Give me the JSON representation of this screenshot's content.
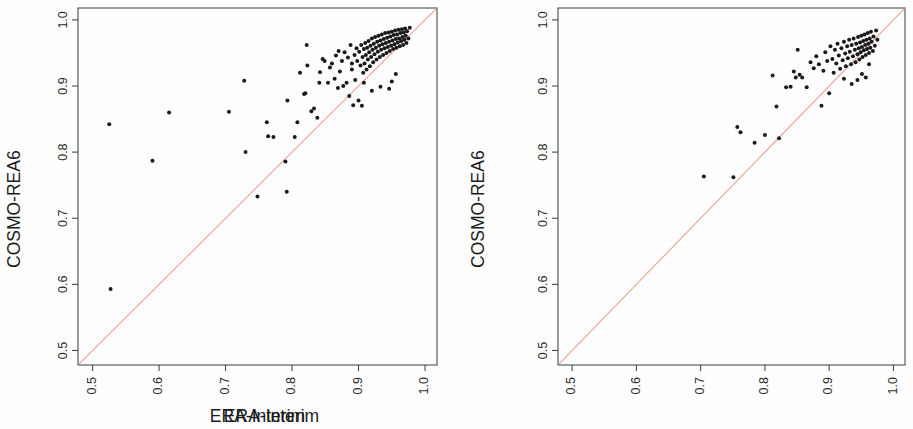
{
  "figure": {
    "width": 913,
    "height": 429,
    "background": "#fefefe",
    "panel_count": 2
  },
  "style": {
    "point_color": "#1a1a1a",
    "line_color": "#f2a090",
    "axis_color": "#3a3a3a",
    "text_color": "#1c1c1c",
    "point_radius": 2.0,
    "line_width": 1.1
  },
  "chart_data": [
    {
      "type": "scatter",
      "panel": "left",
      "title": "",
      "xlabel": "ERA-Interim",
      "ylabel": "COSMO-REA6",
      "xlim": [
        0.478,
        1.018
      ],
      "ylim": [
        0.478,
        1.018
      ],
      "xticks": [
        0.5,
        0.6,
        0.7,
        0.8,
        0.9,
        1.0
      ],
      "xticklabels": [
        "0.5",
        "0.6",
        "0.7",
        "0.8",
        "0.9",
        "1.0"
      ],
      "yticks": [
        0.5,
        0.6,
        0.7,
        0.8,
        0.9,
        1.0
      ],
      "yticklabels": [
        "0.5",
        "0.6",
        "0.7",
        "0.8",
        "0.9",
        "1.0"
      ],
      "grid": false,
      "legend": null,
      "reference_line": {
        "kind": "identity",
        "label": "1:1 line",
        "from": [
          0.478,
          0.478
        ],
        "to": [
          1.018,
          1.018
        ],
        "color": "#f2a090"
      },
      "n_points": 131,
      "points": [
        [
          0.527,
          0.593
        ],
        [
          0.525,
          0.842
        ],
        [
          0.59,
          0.787
        ],
        [
          0.615,
          0.86
        ],
        [
          0.705,
          0.861
        ],
        [
          0.728,
          0.908
        ],
        [
          0.73,
          0.8
        ],
        [
          0.748,
          0.733
        ],
        [
          0.762,
          0.845
        ],
        [
          0.764,
          0.824
        ],
        [
          0.772,
          0.823
        ],
        [
          0.79,
          0.786
        ],
        [
          0.792,
          0.74
        ],
        [
          0.793,
          0.878
        ],
        [
          0.804,
          0.823
        ],
        [
          0.808,
          0.845
        ],
        [
          0.812,
          0.92
        ],
        [
          0.818,
          0.888
        ],
        [
          0.82,
          0.889
        ],
        [
          0.822,
          0.962
        ],
        [
          0.823,
          0.931
        ],
        [
          0.829,
          0.862
        ],
        [
          0.833,
          0.866
        ],
        [
          0.838,
          0.852
        ],
        [
          0.841,
          0.905
        ],
        [
          0.846,
          0.941
        ],
        [
          0.849,
          0.938
        ],
        [
          0.854,
          0.905
        ],
        [
          0.857,
          0.928
        ],
        [
          0.86,
          0.934
        ],
        [
          0.864,
          0.911
        ],
        [
          0.866,
          0.946
        ],
        [
          0.869,
          0.897
        ],
        [
          0.872,
          0.922
        ],
        [
          0.875,
          0.938
        ],
        [
          0.877,
          0.9
        ],
        [
          0.879,
          0.951
        ],
        [
          0.882,
          0.905
        ],
        [
          0.884,
          0.943
        ],
        [
          0.886,
          0.885
        ],
        [
          0.888,
          0.962
        ],
        [
          0.89,
          0.925
        ],
        [
          0.892,
          0.871
        ],
        [
          0.894,
          0.947
        ],
        [
          0.895,
          0.909
        ],
        [
          0.897,
          0.957
        ],
        [
          0.898,
          0.938
        ],
        [
          0.9,
          0.878
        ],
        [
          0.901,
          0.952
        ],
        [
          0.903,
          0.931
        ],
        [
          0.904,
          0.962
        ],
        [
          0.905,
          0.87
        ],
        [
          0.906,
          0.944
        ],
        [
          0.907,
          0.92
        ],
        [
          0.908,
          0.956
        ],
        [
          0.909,
          0.934
        ],
        [
          0.91,
          0.965
        ],
        [
          0.911,
          0.947
        ],
        [
          0.912,
          0.925
        ],
        [
          0.913,
          0.958
        ],
        [
          0.914,
          0.94
        ],
        [
          0.915,
          0.968
        ],
        [
          0.916,
          0.951
        ],
        [
          0.917,
          0.93
        ],
        [
          0.918,
          0.961
        ],
        [
          0.919,
          0.944
        ],
        [
          0.92,
          0.972
        ],
        [
          0.921,
          0.955
        ],
        [
          0.922,
          0.936
        ],
        [
          0.923,
          0.964
        ],
        [
          0.924,
          0.948
        ],
        [
          0.925,
          0.974
        ],
        [
          0.926,
          0.958
        ],
        [
          0.927,
          0.94
        ],
        [
          0.928,
          0.967
        ],
        [
          0.929,
          0.952
        ],
        [
          0.93,
          0.976
        ],
        [
          0.931,
          0.961
        ],
        [
          0.932,
          0.944
        ],
        [
          0.933,
          0.969
        ],
        [
          0.934,
          0.955
        ],
        [
          0.935,
          0.978
        ],
        [
          0.936,
          0.963
        ],
        [
          0.937,
          0.947
        ],
        [
          0.938,
          0.971
        ],
        [
          0.939,
          0.957
        ],
        [
          0.94,
          0.98
        ],
        [
          0.941,
          0.965
        ],
        [
          0.942,
          0.95
        ],
        [
          0.943,
          0.973
        ],
        [
          0.944,
          0.959
        ],
        [
          0.945,
          0.981
        ],
        [
          0.946,
          0.967
        ],
        [
          0.947,
          0.953
        ],
        [
          0.948,
          0.975
        ],
        [
          0.949,
          0.961
        ],
        [
          0.95,
          0.982
        ],
        [
          0.951,
          0.969
        ],
        [
          0.952,
          0.956
        ],
        [
          0.953,
          0.977
        ],
        [
          0.954,
          0.963
        ],
        [
          0.955,
          0.984
        ],
        [
          0.956,
          0.971
        ],
        [
          0.957,
          0.958
        ],
        [
          0.958,
          0.978
        ],
        [
          0.959,
          0.966
        ],
        [
          0.96,
          0.985
        ],
        [
          0.961,
          0.972
        ],
        [
          0.962,
          0.96
        ],
        [
          0.963,
          0.98
        ],
        [
          0.964,
          0.968
        ],
        [
          0.965,
          0.986
        ],
        [
          0.966,
          0.974
        ],
        [
          0.967,
          0.962
        ],
        [
          0.968,
          0.981
        ],
        [
          0.969,
          0.97
        ],
        [
          0.97,
          0.987
        ],
        [
          0.971,
          0.976
        ],
        [
          0.972,
          0.965
        ],
        [
          0.973,
          0.983
        ],
        [
          0.975,
          0.972
        ],
        [
          0.977,
          0.988
        ],
        [
          0.933,
          0.899
        ],
        [
          0.946,
          0.896
        ],
        [
          0.95,
          0.907
        ],
        [
          0.956,
          0.918
        ],
        [
          0.92,
          0.893
        ],
        [
          0.908,
          0.905
        ],
        [
          0.89,
          0.934
        ],
        [
          0.87,
          0.953
        ],
        [
          0.842,
          0.921
        ]
      ]
    },
    {
      "type": "scatter",
      "panel": "right",
      "title": "",
      "xlabel": "ERA-Interim",
      "ylabel": "COSMO-REA6",
      "xlim": [
        0.478,
        1.018
      ],
      "ylim": [
        0.478,
        1.018
      ],
      "xticks": [
        0.5,
        0.6,
        0.7,
        0.8,
        0.9,
        1.0
      ],
      "xticklabels": [
        "0.5",
        "0.6",
        "0.7",
        "0.8",
        "0.9",
        "1.0"
      ],
      "yticks": [
        0.5,
        0.6,
        0.7,
        0.8,
        0.9,
        1.0
      ],
      "yticklabels": [
        "0.5",
        "0.6",
        "0.7",
        "0.8",
        "0.9",
        "1.0"
      ],
      "grid": false,
      "legend": null,
      "reference_line": {
        "kind": "identity",
        "label": "1:1 line",
        "from": [
          0.478,
          0.478
        ],
        "to": [
          1.018,
          1.018
        ],
        "color": "#f2a090"
      },
      "n_points": 84,
      "points": [
        [
          0.705,
          0.763
        ],
        [
          0.751,
          0.762
        ],
        [
          0.757,
          0.838
        ],
        [
          0.762,
          0.83
        ],
        [
          0.784,
          0.814
        ],
        [
          0.8,
          0.826
        ],
        [
          0.812,
          0.916
        ],
        [
          0.818,
          0.869
        ],
        [
          0.822,
          0.821
        ],
        [
          0.833,
          0.898
        ],
        [
          0.84,
          0.899
        ],
        [
          0.845,
          0.922
        ],
        [
          0.848,
          0.913
        ],
        [
          0.851,
          0.955
        ],
        [
          0.854,
          0.917
        ],
        [
          0.858,
          0.913
        ],
        [
          0.865,
          0.898
        ],
        [
          0.871,
          0.936
        ],
        [
          0.876,
          0.927
        ],
        [
          0.88,
          0.945
        ],
        [
          0.884,
          0.933
        ],
        [
          0.888,
          0.87
        ],
        [
          0.891,
          0.923
        ],
        [
          0.894,
          0.951
        ],
        [
          0.897,
          0.938
        ],
        [
          0.9,
          0.889
        ],
        [
          0.902,
          0.96
        ],
        [
          0.905,
          0.941
        ],
        [
          0.907,
          0.92
        ],
        [
          0.909,
          0.955
        ],
        [
          0.911,
          0.934
        ],
        [
          0.913,
          0.964
        ],
        [
          0.915,
          0.946
        ],
        [
          0.917,
          0.926
        ],
        [
          0.919,
          0.957
        ],
        [
          0.921,
          0.939
        ],
        [
          0.923,
          0.967
        ],
        [
          0.925,
          0.949
        ],
        [
          0.926,
          0.93
        ],
        [
          0.928,
          0.96
        ],
        [
          0.929,
          0.942
        ],
        [
          0.931,
          0.97
        ],
        [
          0.932,
          0.952
        ],
        [
          0.934,
          0.933
        ],
        [
          0.935,
          0.962
        ],
        [
          0.937,
          0.945
        ],
        [
          0.938,
          0.972
        ],
        [
          0.94,
          0.955
        ],
        [
          0.941,
          0.936
        ],
        [
          0.942,
          0.964
        ],
        [
          0.944,
          0.948
        ],
        [
          0.945,
          0.974
        ],
        [
          0.946,
          0.957
        ],
        [
          0.947,
          0.94
        ],
        [
          0.948,
          0.966
        ],
        [
          0.949,
          0.951
        ],
        [
          0.95,
          0.976
        ],
        [
          0.951,
          0.959
        ],
        [
          0.952,
          0.944
        ],
        [
          0.953,
          0.968
        ],
        [
          0.954,
          0.954
        ],
        [
          0.955,
          0.978
        ],
        [
          0.956,
          0.962
        ],
        [
          0.957,
          0.947
        ],
        [
          0.958,
          0.97
        ],
        [
          0.959,
          0.956
        ],
        [
          0.96,
          0.98
        ],
        [
          0.961,
          0.964
        ],
        [
          0.962,
          0.95
        ],
        [
          0.963,
          0.972
        ],
        [
          0.964,
          0.958
        ],
        [
          0.965,
          0.982
        ],
        [
          0.966,
          0.967
        ],
        [
          0.968,
          0.953
        ],
        [
          0.969,
          0.975
        ],
        [
          0.971,
          0.961
        ],
        [
          0.973,
          0.984
        ],
        [
          0.975,
          0.97
        ],
        [
          0.944,
          0.909
        ],
        [
          0.951,
          0.918
        ],
        [
          0.957,
          0.913
        ],
        [
          0.935,
          0.903
        ],
        [
          0.962,
          0.933
        ],
        [
          0.923,
          0.911
        ]
      ]
    }
  ]
}
